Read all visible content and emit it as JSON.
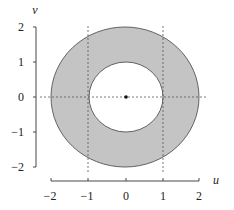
{
  "figure": {
    "type": "annulus",
    "x_axis": {
      "label": "u",
      "ticks": [
        "−2",
        "−1",
        "0",
        "1",
        "2"
      ],
      "range": [
        -2,
        2
      ]
    },
    "y_axis": {
      "label": "v",
      "ticks": [
        "2",
        "1",
        "0",
        "−1",
        "−2"
      ],
      "range": [
        -2,
        2
      ]
    },
    "inner_radius": 1,
    "outer_radius": 2,
    "center": [
      0,
      0
    ],
    "colors": {
      "fill": "#c4c4c4",
      "stroke": "#555555",
      "axis": "#333333",
      "guide": "#555555"
    }
  }
}
